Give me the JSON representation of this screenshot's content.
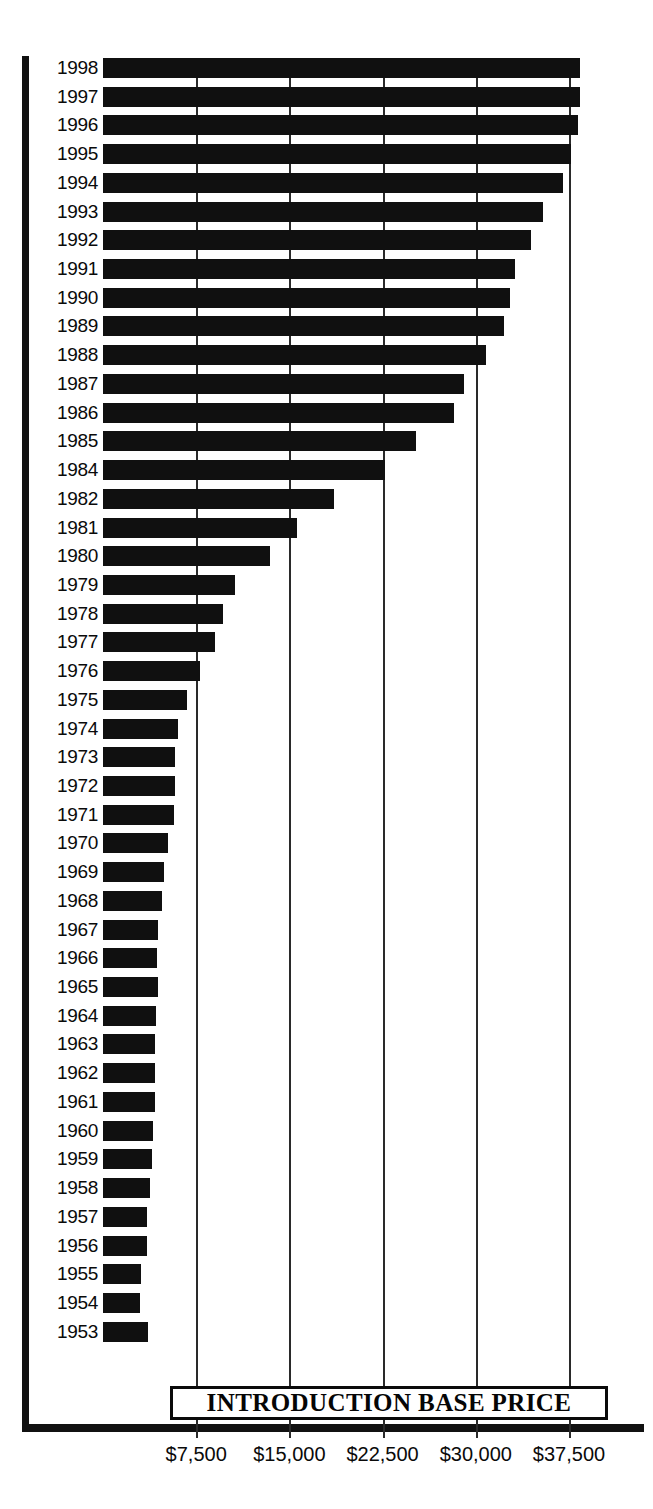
{
  "chart_data": {
    "type": "bar",
    "orientation": "horizontal",
    "title": "INTRODUCTION BASE PRICE",
    "xlabel": "",
    "ylabel": "",
    "xlim": [
      0,
      40000
    ],
    "grid": true,
    "legend": null,
    "tick_labels": [
      "$7,500",
      "$15,000",
      "$22,500",
      "$30,000",
      "$37,500"
    ],
    "tick_values": [
      7500,
      15000,
      22500,
      30000,
      37500
    ],
    "categories": [
      "1998",
      "1997",
      "1996",
      "1995",
      "1994",
      "1993",
      "1992",
      "1991",
      "1990",
      "1989",
      "1988",
      "1987",
      "1986",
      "1985",
      "1984",
      "1982",
      "1981",
      "1980",
      "1979",
      "1978",
      "1977",
      "1976",
      "1975",
      "1974",
      "1973",
      "1972",
      "1971",
      "1970",
      "1969",
      "1968",
      "1967",
      "1966",
      "1965",
      "1964",
      "1963",
      "1962",
      "1961",
      "1960",
      "1959",
      "1958",
      "1957",
      "1956",
      "1955",
      "1954",
      "1953"
    ],
    "values": [
      38400,
      38400,
      38250,
      37650,
      37000,
      35400,
      34450,
      33150,
      32750,
      32250,
      30800,
      29050,
      28250,
      25200,
      22700,
      18600,
      15650,
      13400,
      10600,
      9650,
      9000,
      7800,
      6750,
      6050,
      5800,
      5800,
      5700,
      5250,
      4900,
      4750,
      4400,
      4350,
      4400,
      4250,
      4200,
      4200,
      4200,
      4000,
      3950,
      3800,
      3550,
      3550,
      3050,
      3000,
      3600
    ]
  },
  "axis": {
    "ticks": [
      {
        "label": "$7,500",
        "value": 7500
      },
      {
        "label": "$15,000",
        "value": 15000
      },
      {
        "label": "$22,500",
        "value": 22500
      },
      {
        "label": "$30,000",
        "value": 30000
      },
      {
        "label": "$37,500",
        "value": 37500
      }
    ]
  },
  "title": {
    "text": "INTRODUCTION BASE PRICE"
  }
}
